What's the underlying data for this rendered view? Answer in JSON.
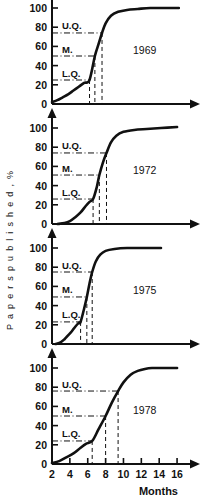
{
  "figure": {
    "ylabel": "P a p e r s   p u b l i s h e d , %",
    "xlabel": "Months",
    "percent_symbol": "%"
  },
  "chart_data": {
    "type": "line",
    "title": "",
    "xlabel": "Months",
    "ylabel": "Papers published, %",
    "xlim": [
      2,
      17
    ],
    "ylim": [
      0,
      105
    ],
    "xticks": [
      2,
      4,
      6,
      8,
      10,
      12,
      14,
      16
    ],
    "xticklabels": [
      "2",
      "4",
      "6",
      "8",
      "10",
      "12",
      "14",
      "16"
    ],
    "yticks": [
      0,
      20,
      40,
      60,
      80,
      100
    ],
    "yticklabels": [
      "0",
      "20",
      "40",
      "60",
      "80",
      "100"
    ],
    "grid": false,
    "legend": null,
    "quartile_labels": {
      "lower": "L.Q.",
      "median": "M.",
      "upper": "U.Q."
    },
    "panels": [
      {
        "year": "1969",
        "quartiles": {
          "lower": {
            "y": 25,
            "x": 6.2
          },
          "median": {
            "y": 50,
            "x": 6.8
          },
          "upper": {
            "y": 74,
            "x": 7.6
          }
        },
        "x": [
          2.0,
          2.6,
          3.2,
          3.8,
          4.4,
          5.0,
          5.6,
          6.2,
          6.8,
          7.2,
          7.6,
          8.0,
          8.6,
          9.4,
          10.4,
          11.6,
          13.0,
          14.6,
          16.2
        ],
        "y": [
          2,
          4,
          7,
          10,
          14,
          18,
          22,
          25,
          50,
          62,
          74,
          84,
          92,
          96,
          98,
          99,
          100,
          100,
          100
        ]
      },
      {
        "year": "1972",
        "quartiles": {
          "lower": {
            "y": 26,
            "x": 6.6
          },
          "median": {
            "y": 51,
            "x": 7.3
          },
          "upper": {
            "y": 74,
            "x": 8.1
          }
        },
        "x": [
          2.6,
          3.4,
          4.0,
          4.6,
          5.2,
          5.8,
          6.2,
          6.6,
          7.0,
          7.3,
          7.7,
          8.1,
          8.6,
          9.2,
          10.0,
          11.2,
          12.6,
          14.2,
          16.0
        ],
        "y": [
          0,
          1,
          3,
          7,
          12,
          19,
          23,
          26,
          38,
          51,
          64,
          74,
          85,
          92,
          96,
          98,
          99,
          100,
          101
        ]
      },
      {
        "year": "1975",
        "quartiles": {
          "lower": {
            "y": 23,
            "x": 5.2
          },
          "median": {
            "y": 49,
            "x": 5.9
          },
          "upper": {
            "y": 75,
            "x": 6.5
          }
        },
        "x": [
          2.4,
          3.0,
          3.4,
          3.8,
          4.2,
          4.6,
          5.0,
          5.2,
          5.6,
          5.9,
          6.2,
          6.5,
          6.9,
          7.4,
          8.0,
          9.0,
          10.4,
          12.2,
          14.2
        ],
        "y": [
          0,
          2,
          5,
          9,
          13,
          18,
          22,
          23,
          37,
          49,
          63,
          75,
          86,
          93,
          97,
          99,
          100,
          100,
          100
        ]
      },
      {
        "year": "1978",
        "quartiles": {
          "lower": {
            "y": 24,
            "x": 6.5
          },
          "median": {
            "y": 50,
            "x": 8.0
          },
          "upper": {
            "y": 76,
            "x": 9.4
          }
        },
        "x": [
          2.0,
          2.8,
          3.6,
          4.4,
          5.2,
          5.8,
          6.5,
          7.2,
          8.0,
          8.7,
          9.4,
          10.0,
          10.8,
          11.6,
          12.4,
          13.2,
          14.0,
          15.0,
          16.0
        ],
        "y": [
          1,
          3,
          7,
          11,
          17,
          21,
          24,
          36,
          50,
          64,
          76,
          85,
          93,
          97,
          99,
          100,
          100,
          100,
          100
        ]
      }
    ]
  }
}
